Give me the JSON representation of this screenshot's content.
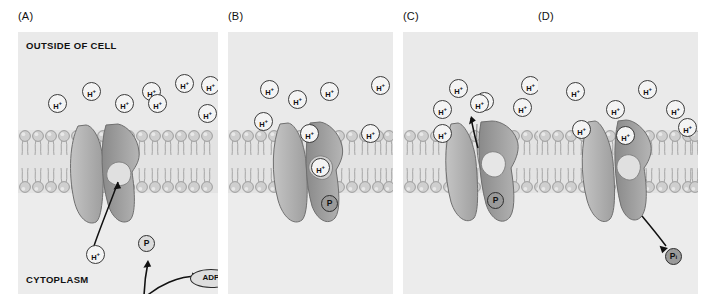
{
  "figure": {
    "type": "diagram",
    "panel_count": 4
  },
  "common": {
    "outside_label": "OUTSIDE OF CELL",
    "cytoplasm_label": "CYTOPLASM",
    "proton_label_text": "H",
    "proton_label_charge": "+",
    "colors": {
      "panel_bg": "#ebebeb",
      "membrane_head": "#c9c9c9",
      "pump_left_lobe": "#b0b0b0",
      "pump_right_lobe": "#8d8d8d",
      "ion_fill": "#f4f4f4",
      "outline": "#3b3b3b"
    }
  },
  "panels": [
    {
      "id": "A",
      "label": "(A)",
      "outside_label": "OUTSIDE OF CELL",
      "cytoplasm_label": "CYTOPLASM",
      "proton_count_outside": 8,
      "protons_outside": [
        {
          "x": 30,
          "y": 62
        },
        {
          "x": 64,
          "y": 50
        },
        {
          "x": 97,
          "y": 62
        },
        {
          "x": 124,
          "y": 50
        },
        {
          "x": 130,
          "y": 62
        },
        {
          "x": 157,
          "y": 42
        },
        {
          "x": 183,
          "y": 44
        },
        {
          "x": 180,
          "y": 72
        }
      ],
      "cytoplasm_proton": {
        "x": 75,
        "y": 222,
        "label": "H+"
      },
      "phosphate": {
        "label": "P",
        "subscript": "",
        "style": "light"
      },
      "atp_label": "ATP",
      "adp_label": "ADP",
      "pump_state": "open to cytoplasm, H+ binding site empty-to-binding",
      "arrows": [
        "H+ moves up into binding site",
        "ATP donates phosphate to pump",
        "ATP converts to ADP"
      ]
    },
    {
      "id": "B",
      "label": "(B)",
      "proton_count_outside": 7,
      "protons_outside": [
        {
          "x": 32,
          "y": 48
        },
        {
          "x": 60,
          "y": 58
        },
        {
          "x": 92,
          "y": 50
        },
        {
          "x": 143,
          "y": 44
        },
        {
          "x": 26,
          "y": 80
        },
        {
          "x": 72,
          "y": 92
        },
        {
          "x": 133,
          "y": 92
        }
      ],
      "bound_proton_label": "H+",
      "phosphate": {
        "label": "P",
        "subscript": "",
        "style": "mid"
      },
      "pump_state": "phosphorylated, H+ occluded inside pump"
    },
    {
      "id": "C",
      "label": "(C)",
      "proton_count_outside": 8,
      "protons_outside": [
        {
          "x": 30,
          "y": 68
        },
        {
          "x": 46,
          "y": 47
        },
        {
          "x": 72,
          "y": 60
        },
        {
          "x": 30,
          "y": 92
        },
        {
          "x": 118,
          "y": 44
        },
        {
          "x": 110,
          "y": 66
        },
        {
          "x": 152,
          "y": 60
        },
        {
          "x": 145,
          "y": 85
        }
      ],
      "released_proton": {
        "x": 78,
        "y": 95,
        "label": "H+"
      },
      "phosphate": {
        "label": "P",
        "subscript": "",
        "style": "mid"
      },
      "pump_state": "conformational change, H+ released to outside",
      "arrows": [
        "H+ ejected upward out of the cell"
      ]
    },
    {
      "id": "D",
      "label": "(D)",
      "proton_count_outside": 7,
      "protons_outside": [
        {
          "x": 28,
          "y": 50
        },
        {
          "x": 68,
          "y": 68
        },
        {
          "x": 34,
          "y": 88
        },
        {
          "x": 78,
          "y": 94
        },
        {
          "x": 100,
          "y": 48
        },
        {
          "x": 128,
          "y": 68
        },
        {
          "x": 155,
          "y": 72
        }
      ],
      "phosphate": {
        "label": "P",
        "subscript": "i",
        "style": "mid"
      },
      "pump_state": "dephosphorylation, Pi released into cytoplasm",
      "arrows": [
        "Pi released from pump into cytoplasm"
      ]
    }
  ]
}
